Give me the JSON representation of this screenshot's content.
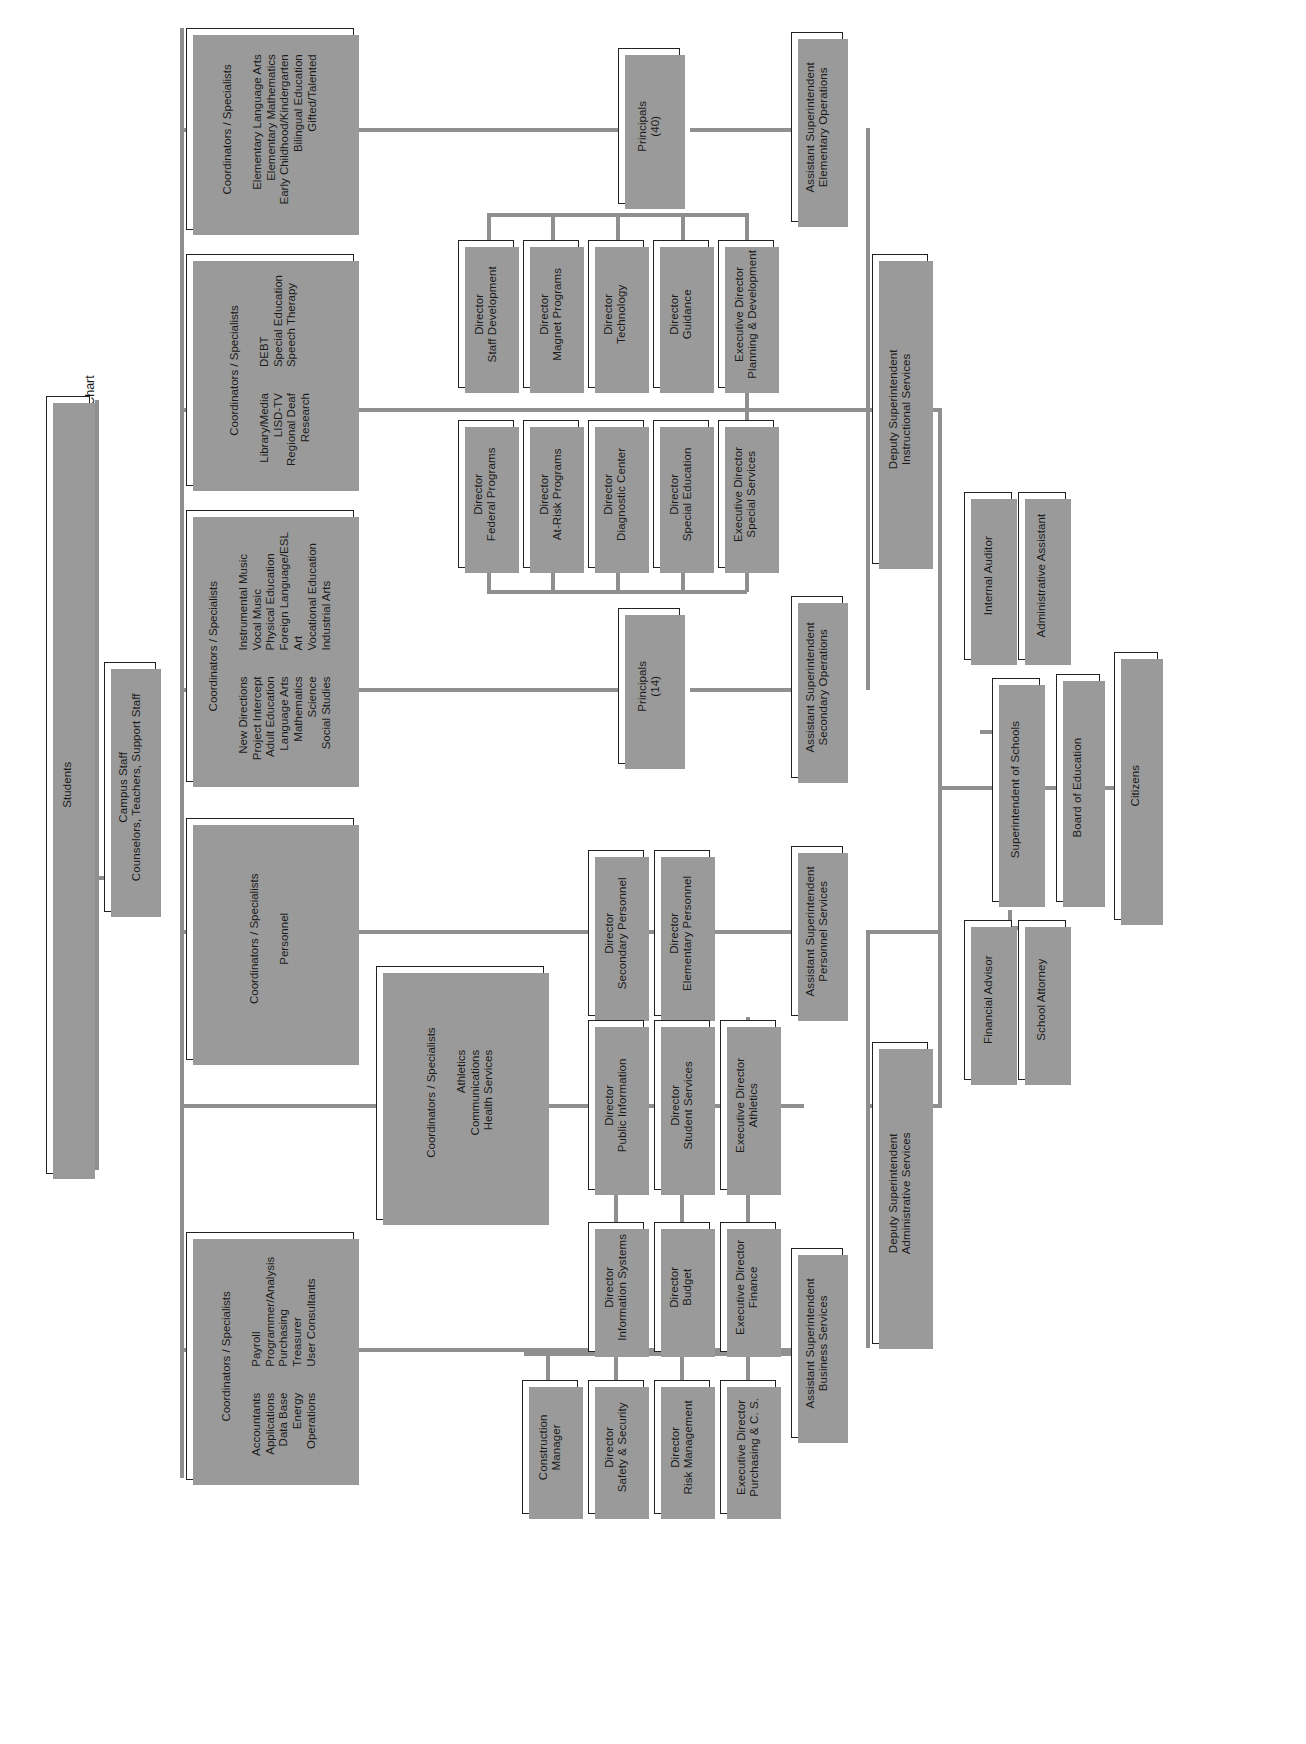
{
  "chart_title": "Lubbock Independent School District Organizational Chart",
  "boxes": {
    "students": {
      "label": "Students"
    },
    "campus_staff": {
      "line1": "Campus Staff",
      "line2": "Counselors, Teachers, Support Staff"
    },
    "coord_elementary": {
      "header": "Coordinators / Specialists",
      "col_right": [
        "Elementary Language Arts",
        "Elementary Mathematics",
        "Early Childhood/Kindergarten",
        "Bilingual Education",
        "Gifted/Talented"
      ],
      "col_left": []
    },
    "coord_special": {
      "header": "Coordinators / Specialists",
      "col_right": [
        "DEBT",
        "Special Education",
        "Speech Therapy"
      ],
      "col_left": [
        "Library/Media",
        "LISD-TV",
        "Regional Deaf",
        "Research"
      ]
    },
    "coord_secondary": {
      "header": "Coordinators / Specialists",
      "col_right": [
        "Instrumental Music",
        "Vocal Music",
        "Physical Education",
        "Foreign Language/ESL",
        "Art",
        "Vocational Education",
        "Industrial Arts"
      ],
      "col_left": [
        "New Directions",
        "Project Intercept",
        "Adult Education",
        "Language Arts",
        "Mathematics",
        "Science",
        "Social Studies"
      ]
    },
    "coord_personnel": {
      "header": "Coordinators / Specialists",
      "col_right": [],
      "col_left": [
        "Personnel"
      ]
    },
    "coord_athletics": {
      "header": "Coordinators / Specialists",
      "col_right": [],
      "col_left": [
        "Athletics",
        "Communications",
        "Health Services"
      ]
    },
    "coord_business": {
      "header": "Coordinators / Specialists",
      "col_right": [
        "Payroll",
        "Programmer/Analysis",
        "Purchasing",
        "Treasurer",
        "User Consultants"
      ],
      "col_left": [
        "Accountants",
        "Applications",
        "Data Base",
        "Energy",
        "Operations"
      ]
    },
    "principals_40": {
      "line1": "Principals",
      "line2": "(40)"
    },
    "principals_14": {
      "line1": "Principals",
      "line2": "(14)"
    },
    "asst_supt_elem": {
      "line1": "Assistant Superintendent",
      "line2": "Elementary Operations"
    },
    "asst_supt_sec": {
      "line1": "Assistant Superintendent",
      "line2": "Secondary Operations"
    },
    "asst_supt_personnel": {
      "line1": "Assistant Superintendent",
      "line2": "Personnel Services"
    },
    "asst_supt_business": {
      "line1": "Assistant Superintendent",
      "line2": "Business Services"
    },
    "dir_staff_dev": {
      "line1": "Director",
      "line2": "Staff Development"
    },
    "dir_magnet": {
      "line1": "Director",
      "line2": "Magnet Programs"
    },
    "dir_technology": {
      "line1": "Director",
      "line2": "Technology"
    },
    "dir_guidance": {
      "line1": "Director",
      "line2": "Guidance"
    },
    "exec_dir_planning": {
      "line1": "Executive Director",
      "line2": "Planning & Development"
    },
    "dir_federal": {
      "line1": "Director",
      "line2": "Federal Programs"
    },
    "dir_atrisk": {
      "line1": "Director",
      "line2": "At-Risk Programs"
    },
    "dir_diagnostic": {
      "line1": "Director",
      "line2": "Diagnostic Center"
    },
    "dir_speced": {
      "line1": "Director",
      "line2": "Special Education"
    },
    "exec_dir_special": {
      "line1": "Executive Director",
      "line2": "Special Services"
    },
    "dir_sec_personnel": {
      "line1": "Director",
      "line2": "Secondary Personnel"
    },
    "dir_elem_personnel": {
      "line1": "Director",
      "line2": "Elementary Personnel"
    },
    "dir_public_info": {
      "line1": "Director",
      "line2": "Public Information"
    },
    "dir_student_svcs": {
      "line1": "Director",
      "line2": "Student Services"
    },
    "exec_dir_athletics": {
      "line1": "Executive Director",
      "line2": "Athletics"
    },
    "dir_info_systems": {
      "line1": "Director",
      "line2": "Information Systems"
    },
    "dir_budget": {
      "line1": "Director",
      "line2": "Budget"
    },
    "exec_dir_finance": {
      "line1": "Executive Director",
      "line2": "Finance"
    },
    "construction_mgr": {
      "line1": "Construction",
      "line2": "Manager"
    },
    "dir_safety": {
      "line1": "Director",
      "line2": "Safety & Security"
    },
    "dir_risk": {
      "line1": "Director",
      "line2": "Risk Management"
    },
    "exec_dir_purchasing": {
      "line1": "Executive Director",
      "line2": "Purchasing & C. S."
    },
    "deputy_instructional": {
      "line1": "Deputy Superintendent",
      "line2": "Instructional Services"
    },
    "deputy_administrative": {
      "line1": "Deputy Superintendent",
      "line2": "Administrative Services"
    },
    "internal_auditor": {
      "label": "Internal Auditor"
    },
    "admin_assistant": {
      "label": "Administrative Assistant"
    },
    "superintendent": {
      "label": "Superintendent of Schools"
    },
    "financial_advisor": {
      "label": "Financial Advisor"
    },
    "school_attorney": {
      "label": "School Attorney"
    },
    "board_of_education": {
      "label": "Board of Education"
    },
    "citizens": {
      "label": "Citizens"
    }
  },
  "colors": {
    "line": "#8f8f8f",
    "border": "#222222",
    "shadow": "#9a9a9a",
    "background": "#ffffff"
  }
}
